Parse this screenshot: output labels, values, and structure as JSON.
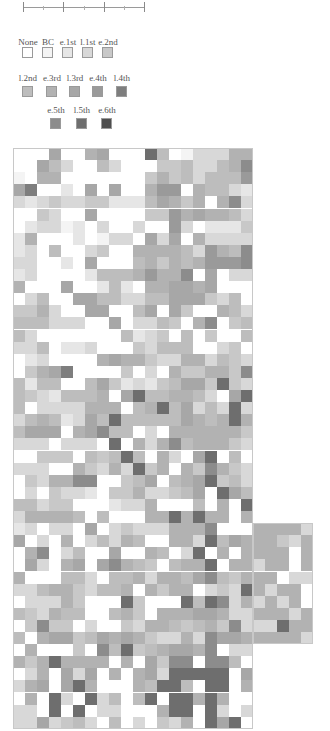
{
  "scale_bar": {
    "x_start": 23,
    "x_end": 144,
    "y": 7,
    "major_ticks": [
      23,
      63,
      104,
      144
    ],
    "minor_ticks": [
      43,
      84,
      124
    ]
  },
  "legend": {
    "levels": [
      {
        "label": "None",
        "color": "#ffffff",
        "x": 28,
        "row": 0
      },
      {
        "label": "BC",
        "color": "#f4f4f4",
        "x": 48,
        "row": 0
      },
      {
        "label": "e.1st",
        "color": "#e6e6e6",
        "x": 68,
        "row": 0
      },
      {
        "label": "l.1st",
        "color": "#d8d8d8",
        "x": 88,
        "row": 0
      },
      {
        "label": "e.2nd",
        "color": "#c8c8c8",
        "x": 108,
        "row": 0
      },
      {
        "label": "l.2nd",
        "color": "#bdbdbd",
        "x": 28,
        "row": 1
      },
      {
        "label": "e.3rd",
        "color": "#b2b2b2",
        "x": 52,
        "row": 1
      },
      {
        "label": "l.3rd",
        "color": "#a7a7a7",
        "x": 75,
        "row": 1
      },
      {
        "label": "e.4th",
        "color": "#9a9a9a",
        "x": 98,
        "row": 1
      },
      {
        "label": "l.4th",
        "color": "#7e7e7e",
        "x": 122,
        "row": 1
      },
      {
        "label": "e.5th",
        "color": "#8c8c8c",
        "x": 56,
        "row": 2
      },
      {
        "label": "l.5th",
        "color": "#6e6e6e",
        "x": 82,
        "row": 2
      },
      {
        "label": "e.6th",
        "color": "#4e4e4e",
        "x": 107,
        "row": 2
      }
    ],
    "row_label_y": [
      37,
      73,
      105
    ],
    "row_swatch_y": [
      47,
      86,
      118
    ]
  },
  "grid": {
    "left": 13,
    "top": 148,
    "cell_w": 12,
    "cell_h": 12.1,
    "main_cols": 20,
    "rows": [
      "00070067000b50133366",
      "0075300530004453356a",
      "10660000000464535558",
      "79002070700688065532",
      "323433442225764606a3",
      "00430070000448676653",
      "02331203003008302224",
      "26000201330737063333",
      "2305003400666653865a",
      "3300207000564656888a",
      "23000025556866a07033",
      "60007002520667767000",
      "03500775533557774350",
      "44630077005707400653",
      "5553330070335406a045",
      "53000000052340504005",
      "33502230004355500340",
      "02300006766433663543",
      "0467900004030644664a",
      "52550057423245774b43",
      "5432555607b55665307b",
      "503333666056b57353b3",
      "35652375b555557656b6",
      "5777067a550306666664",
      "33303330b0636a566643",
      "004440545b506307b050",
      "3330064363b46064a643",
      "04366aa004570567b453",
      "03043320446334570b75",
      "5534400023360005060b",
      "3666650500066b6b6606",
      "2303307034333666a00",
      "7030603536500663b576",
      "06a035007006503b0606",
      "07306707a6540566b066",
      "6000553055636657a546",
      "3356643556064660343b",
      "033364000b4000b5ba36",
      "54365500564066677633",
      "04a440300436654564a3",
      "5067745767643363a776",
      "0600040a5b456776a033",
      "646b666606074aa0aa50",
      "0360737060673bbbbb07",
      "36707b600065bb50bb06",
      "060b30b3505b0bb6b600",
      "330b0b0330006bb0b303",
      "3373453050304360b7b0"
    ],
    "extension": {
      "start_row": 31,
      "start_col": 20,
      "rows": [
        "66663",
        "66436",
        "66606",
        "36606",
        "66033",
        "63660",
        "36360",
        "66636",
        "33b66",
        "66663"
      ]
    }
  }
}
